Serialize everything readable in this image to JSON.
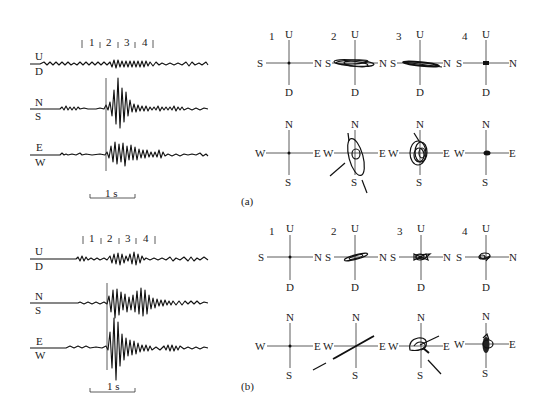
{
  "figure": {
    "panels": [
      {
        "id": "a",
        "caption": "(a)",
        "seismogram": {
          "window_labels": [
            "1",
            "2",
            "3",
            "4"
          ],
          "channels": [
            {
              "top": "U",
              "bottom": "D"
            },
            {
              "top": "N",
              "bottom": "S"
            },
            {
              "top": "E",
              "bottom": "W"
            }
          ],
          "scale_bar": "1 s"
        },
        "hodograms": {
          "vertical_plane": [
            {
              "num": "1",
              "up": "U",
              "down": "D",
              "left": "S",
              "right": "N"
            },
            {
              "num": "2",
              "up": "U",
              "down": "D",
              "left": "S",
              "right": "N"
            },
            {
              "num": "3",
              "up": "U",
              "down": "D",
              "left": "S",
              "right": "N"
            },
            {
              "num": "4",
              "up": "U",
              "down": "D",
              "left": "S",
              "right": "N"
            }
          ],
          "horizontal_plane": [
            {
              "up": "N",
              "down": "S",
              "left": "W",
              "right": "E"
            },
            {
              "up": "N",
              "down": "S",
              "left": "W",
              "right": "E"
            },
            {
              "up": "N",
              "down": "S",
              "left": "W",
              "right": "E"
            },
            {
              "up": "N",
              "down": "S",
              "left": "W",
              "right": "E"
            }
          ]
        }
      },
      {
        "id": "b",
        "caption": "(b)",
        "seismogram": {
          "window_labels": [
            "1",
            "2",
            "3",
            "4"
          ],
          "channels": [
            {
              "top": "U",
              "bottom": "D"
            },
            {
              "top": "N",
              "bottom": "S"
            },
            {
              "top": "E",
              "bottom": "W"
            }
          ],
          "scale_bar": "1 s"
        },
        "hodograms": {
          "vertical_plane": [
            {
              "num": "1",
              "up": "U",
              "down": "D",
              "left": "S",
              "right": "N"
            },
            {
              "num": "2",
              "up": "U",
              "down": "D",
              "left": "S",
              "right": "N"
            },
            {
              "num": "3",
              "up": "U",
              "down": "D",
              "left": "S",
              "right": "N"
            },
            {
              "num": "4",
              "up": "U",
              "down": "D",
              "left": "S",
              "right": "N"
            }
          ],
          "horizontal_plane": [
            {
              "up": "N",
              "down": "S",
              "left": "W",
              "right": "E"
            },
            {
              "up": "N",
              "down": "S",
              "left": "W",
              "right": "E"
            },
            {
              "up": "N",
              "down": "S",
              "left": "W",
              "right": "E"
            },
            {
              "up": "N",
              "down": "S",
              "left": "W",
              "right": "E"
            }
          ]
        }
      }
    ]
  }
}
